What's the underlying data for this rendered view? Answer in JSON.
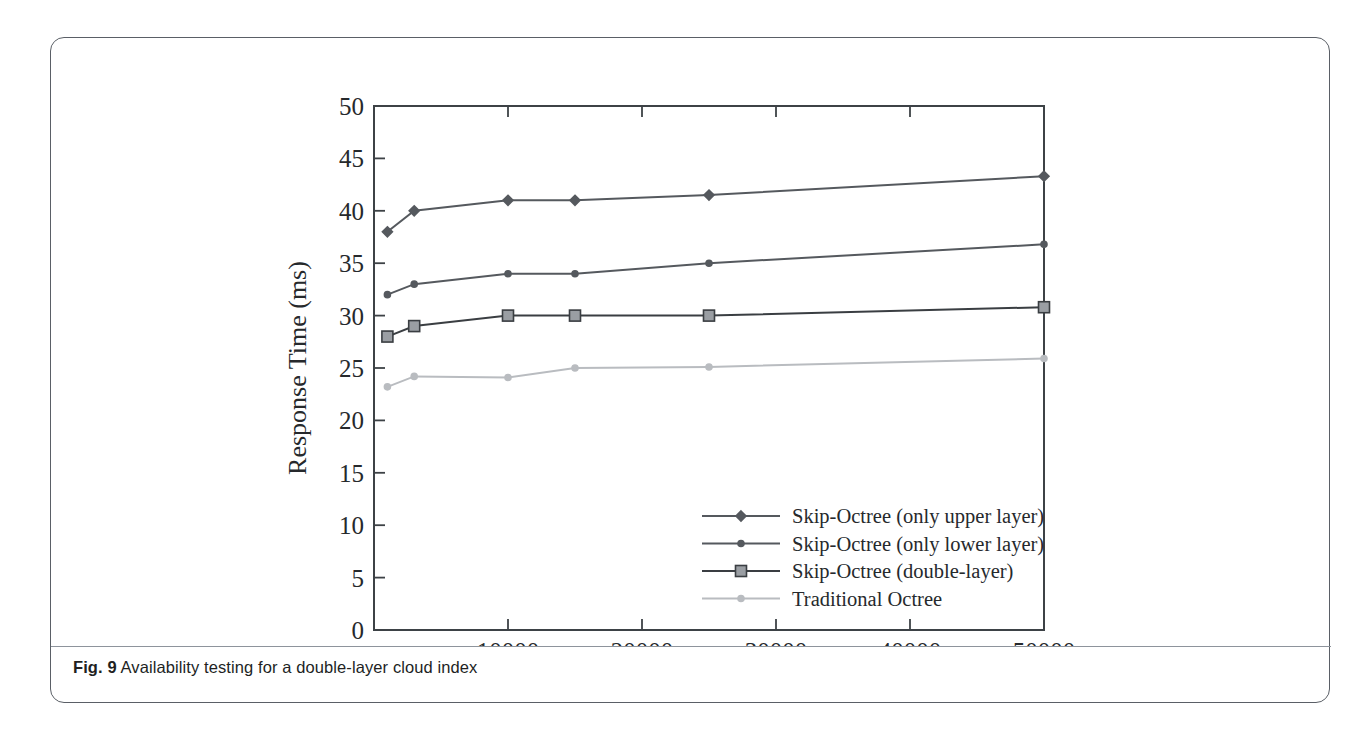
{
  "figure": {
    "caption_label": "Fig. 9",
    "caption_text": "Availability testing for a double-layer cloud index"
  },
  "chart_data": {
    "type": "line",
    "title": "",
    "xlabel": "Amount of data",
    "ylabel": "Response Time (ms)",
    "xlim": [
      0,
      50000
    ],
    "ylim": [
      0,
      50
    ],
    "xticks": [
      0,
      10000,
      20000,
      30000,
      40000,
      50000
    ],
    "xtick_labels": [
      "0",
      "10000",
      "20000",
      "30000",
      "40000",
      "50000"
    ],
    "yticks": [
      0,
      5,
      10,
      15,
      20,
      25,
      30,
      35,
      40,
      45,
      50
    ],
    "ytick_labels": [
      "0",
      "5",
      "10",
      "15",
      "20",
      "25",
      "30",
      "35",
      "40",
      "45",
      "50"
    ],
    "grid": false,
    "legend_position": "lower right",
    "x": [
      1000,
      3000,
      10000,
      15000,
      25000,
      50000
    ],
    "series": [
      {
        "name": "Skip-Octree (only upper layer)",
        "values": [
          38,
          40,
          41,
          41,
          41.5,
          43.3
        ],
        "color": "#55595e",
        "marker": "diamond"
      },
      {
        "name": "Skip-Octree (only lower layer)",
        "values": [
          32,
          33,
          34,
          34,
          35,
          36.8
        ],
        "color": "#55595e",
        "marker": "dot"
      },
      {
        "name": "Skip-Octree (double-layer)",
        "values": [
          28,
          29,
          30,
          30,
          30,
          30.8
        ],
        "color": "#3a3e42",
        "marker": "square"
      },
      {
        "name": "Traditional Octree",
        "values": [
          23.2,
          24.2,
          24.1,
          25,
          25.1,
          25.9
        ],
        "color": "#b9bcc0",
        "marker": "dot"
      }
    ]
  }
}
